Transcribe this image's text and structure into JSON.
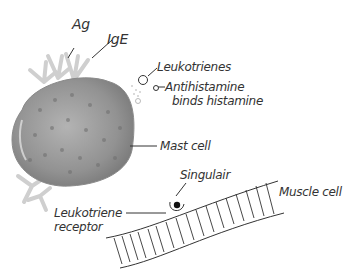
{
  "diagram": {
    "labels": {
      "ag": "Ag",
      "ige": "IgE",
      "leukotrienes": "Leukotrienes",
      "antihistamine_line1": "Antihistamine",
      "antihistamine_line2": "binds histamine",
      "mast_cell": "Mast cell",
      "singulair": "Singulair",
      "muscle_cell": "Muscle cell",
      "leukotriene_receptor_line1": "Leukotriene",
      "leukotriene_receptor_line2": "receptor"
    },
    "colors": {
      "mast_cell_fill": "#9a9a9a",
      "mast_cell_spots": "#6f6f6f",
      "antibody": "#c8c8c8",
      "ink": "#333333"
    }
  }
}
